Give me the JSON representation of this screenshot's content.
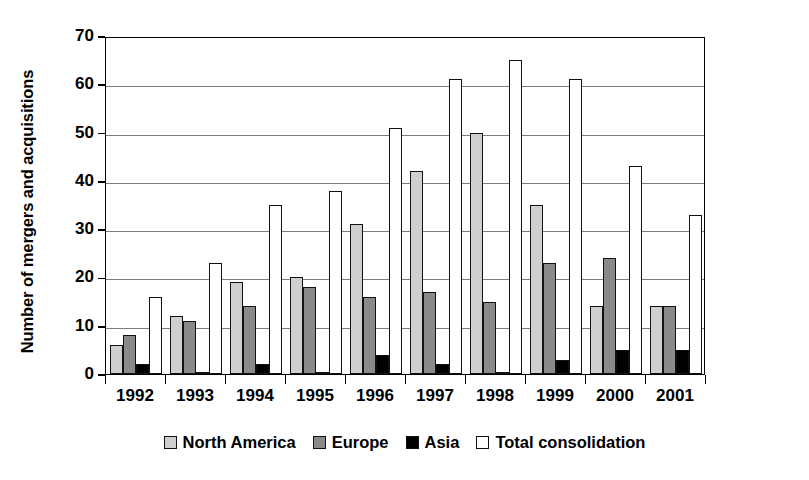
{
  "chart_data": {
    "type": "bar",
    "title": "",
    "xlabel": "",
    "ylabel": "Number of mergers and acquisitions",
    "ylim": [
      0,
      70
    ],
    "yticks": [
      0,
      10,
      20,
      30,
      40,
      50,
      60,
      70
    ],
    "grid": true,
    "legend_position": "bottom",
    "categories": [
      "1992",
      "1993",
      "1994",
      "1995",
      "1996",
      "1997",
      "1998",
      "1999",
      "2000",
      "2001"
    ],
    "series": [
      {
        "name": "North America",
        "color": "#cfcfcf",
        "values": [
          6,
          12,
          19,
          20,
          31,
          42,
          50,
          35,
          14,
          14
        ]
      },
      {
        "name": "Europe",
        "color": "#8a8a8a",
        "values": [
          8,
          11,
          14,
          18,
          16,
          17,
          15,
          23,
          24,
          14
        ]
      },
      {
        "name": "Asia",
        "color": "#000000",
        "values": [
          2,
          0,
          2,
          0,
          4,
          2,
          0,
          3,
          5,
          5
        ]
      },
      {
        "name": "Total consolidation",
        "color": "#ffffff",
        "values": [
          16,
          23,
          35,
          38,
          51,
          61,
          65,
          61,
          43,
          33
        ]
      }
    ]
  }
}
